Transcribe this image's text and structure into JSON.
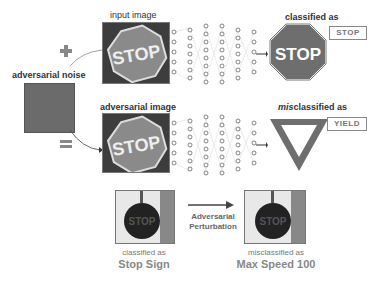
{
  "top_row": {
    "input_label": "input image",
    "output_label": "classified as",
    "prediction": "STOP",
    "sign_text": "STOP"
  },
  "noise": {
    "label": "adversarial noise",
    "plus_icon": "plus-icon",
    "equals_icon": "equals-icon"
  },
  "bottom_row": {
    "input_label": "adversarial image",
    "output_label_prefix": "mis",
    "output_label_rest": "classified as",
    "prediction": "YIELD",
    "sign_text": "STOP"
  },
  "example": {
    "left_caption": "classified as",
    "left_class": "Stop Sign",
    "arrow_line1": "Adversarial",
    "arrow_line2": "Perturbation",
    "right_caption": "misclassified as",
    "right_class": "Max Speed 100",
    "sign_text": "STOP"
  },
  "colors": {
    "sign_gray": "#6e6e6e",
    "text_gray": "#888888",
    "noise_gray": "#6b6b6b"
  }
}
